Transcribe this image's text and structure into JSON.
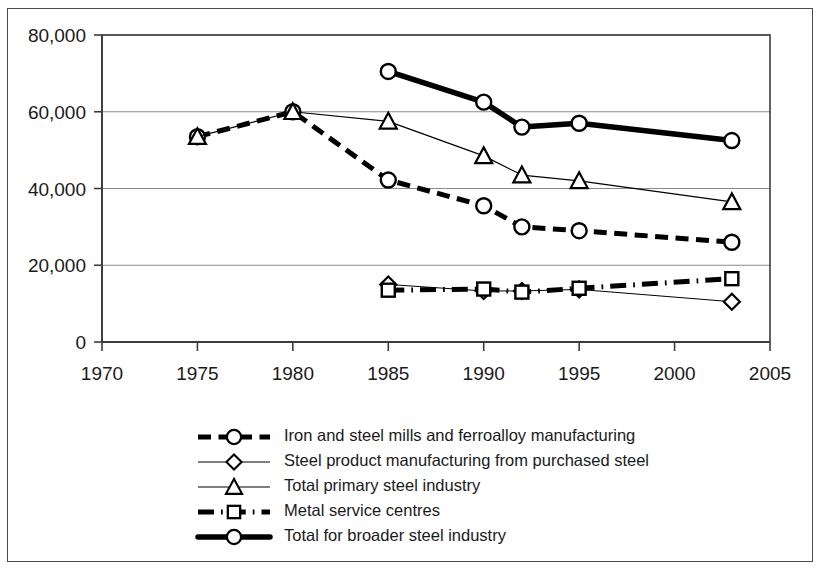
{
  "chart_data": {
    "type": "line",
    "title": "",
    "xlabel": "",
    "ylabel": "",
    "xlim": [
      1970,
      2005
    ],
    "ylim": [
      0,
      80000
    ],
    "grid": true,
    "legend_position": "bottom",
    "x_ticks": [
      "1970",
      "1975",
      "1980",
      "1985",
      "1990",
      "1995",
      "2000",
      "2005"
    ],
    "y_ticks": [
      "0",
      "20,000",
      "40,000",
      "60,000",
      "80,000"
    ],
    "x_tick_values": [
      1970,
      1975,
      1980,
      1985,
      1990,
      1995,
      2000,
      2005
    ],
    "y_tick_values": [
      0,
      20000,
      40000,
      60000,
      80000
    ],
    "series": [
      {
        "name": "Iron and steel mills and ferroalloy manufacturing",
        "marker": "circle",
        "line_style": "dashed",
        "line_width": 5,
        "x": [
          1975,
          1980,
          1985,
          1990,
          1992,
          1995,
          2003
        ],
        "values": [
          53500,
          60000,
          42200,
          35500,
          30000,
          29000,
          26000
        ]
      },
      {
        "name": "Steel product manufacturing from purchased steel",
        "marker": "diamond",
        "line_style": "thin",
        "line_width": 1,
        "x": [
          1985,
          1990,
          1992,
          1995,
          2003
        ],
        "values": [
          15000,
          13300,
          13300,
          13700,
          10500
        ]
      },
      {
        "name": "Total primary steel industry",
        "marker": "triangle",
        "line_style": "thin",
        "line_width": 1.2,
        "x": [
          1975,
          1980,
          1985,
          1990,
          1992,
          1995,
          2003
        ],
        "values": [
          53500,
          60000,
          57500,
          48500,
          43500,
          42000,
          36500
        ]
      },
      {
        "name": "Metal service centres",
        "marker": "square",
        "line_style": "dash-dot",
        "line_width": 5,
        "x": [
          1985,
          1990,
          1992,
          1995,
          2003
        ],
        "values": [
          13500,
          13800,
          13000,
          14000,
          16500
        ]
      },
      {
        "name": "Total for broader steel industry",
        "marker": "circle",
        "line_style": "solid",
        "line_width": 5.5,
        "x": [
          1985,
          1990,
          1992,
          1995,
          2003
        ],
        "values": [
          70500,
          62500,
          56000,
          57000,
          52500
        ]
      }
    ]
  },
  "legend": {
    "entries": [
      {
        "label": "Iron and steel mills and ferroalloy manufacturing",
        "marker": "circle",
        "style": "dashed"
      },
      {
        "label": "Steel product manufacturing from purchased steel",
        "marker": "diamond",
        "style": "thin"
      },
      {
        "label": "Total primary steel industry",
        "marker": "triangle",
        "style": "thin"
      },
      {
        "label": "Metal service centres",
        "marker": "square",
        "style": "dash-dot"
      },
      {
        "label": "Total for broader steel industry",
        "marker": "circle",
        "style": "solid"
      }
    ]
  }
}
